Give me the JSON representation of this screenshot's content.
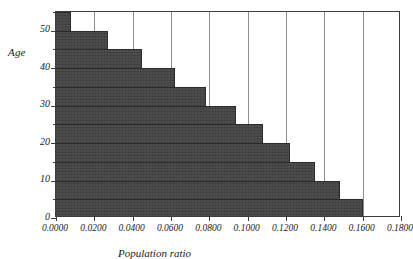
{
  "chart_data": {
    "type": "bar",
    "orientation": "horizontal",
    "title": "",
    "xlabel": "Population ratio",
    "ylabel": "Age",
    "xlim": [
      0.0,
      0.18
    ],
    "ylim": [
      0,
      55
    ],
    "xticks": [
      0.0,
      0.02,
      0.04,
      0.06,
      0.08,
      0.1,
      0.12,
      0.14,
      0.16,
      0.18
    ],
    "xtick_labels": [
      "0.0000",
      "0.0200",
      "0.0400",
      "0.0600",
      "0.0800",
      "0.1000",
      "0.1200",
      "0.1400",
      "0.1600",
      "0.1800"
    ],
    "yticks": [
      0,
      10,
      20,
      30,
      40,
      50
    ],
    "ytick_labels": [
      "0",
      "10",
      "20",
      "30",
      "40",
      "50"
    ],
    "yticks_minor": [
      5,
      15,
      25,
      35,
      45,
      55
    ],
    "grid": "vertical",
    "legend": "none",
    "bar_color": "#4d4d4d",
    "axis_color": "#3d3d3d",
    "grid_color": "#8f8f8f",
    "age_bands": [
      "0-5",
      "5-10",
      "10-15",
      "15-20",
      "20-25",
      "25-30",
      "30-35",
      "35-40",
      "40-45",
      "45-50",
      "50-55"
    ],
    "categories": [
      2.5,
      7.5,
      12.5,
      17.5,
      22.5,
      27.5,
      32.5,
      37.5,
      42.5,
      47.5,
      52.5
    ],
    "values": [
      0.16,
      0.148,
      0.135,
      0.122,
      0.108,
      0.094,
      0.078,
      0.062,
      0.045,
      0.027,
      0.008
    ],
    "bars": [
      {
        "age_low": 0,
        "age_high": 5,
        "value": 0.16
      },
      {
        "age_low": 5,
        "age_high": 10,
        "value": 0.148
      },
      {
        "age_low": 10,
        "age_high": 15,
        "value": 0.135
      },
      {
        "age_low": 15,
        "age_high": 20,
        "value": 0.122
      },
      {
        "age_low": 20,
        "age_high": 25,
        "value": 0.108
      },
      {
        "age_low": 25,
        "age_high": 30,
        "value": 0.094
      },
      {
        "age_low": 30,
        "age_high": 35,
        "value": 0.078
      },
      {
        "age_low": 35,
        "age_high": 40,
        "value": 0.062
      },
      {
        "age_low": 40,
        "age_high": 45,
        "value": 0.045
      },
      {
        "age_low": 45,
        "age_high": 50,
        "value": 0.027
      },
      {
        "age_low": 50,
        "age_high": 55,
        "value": 0.008
      }
    ]
  }
}
